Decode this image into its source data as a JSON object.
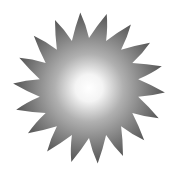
{
  "icon": {
    "name": "sun-icon",
    "spikes": 18,
    "center": [
      89,
      88
    ],
    "outer_radius": 76,
    "inner_radius": 50,
    "colors": {
      "center": "#ffffff",
      "mid": "#b0b0b0",
      "edge": "#555555",
      "background": "#ffffff"
    }
  }
}
